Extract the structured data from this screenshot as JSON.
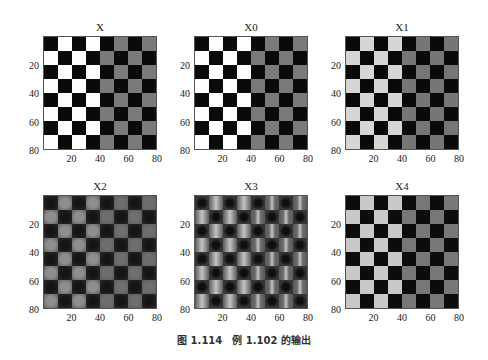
{
  "figure": {
    "caption": "图 1.114　例 1.102 的输出",
    "panels": [
      {
        "title": "X",
        "left_light": "#ffffff",
        "right_light": "#7a7a7a",
        "dark": "#0a0a0a",
        "style": "sharp"
      },
      {
        "title": "X0",
        "left_light": "#ffffff",
        "right_light": "#7a7a7a",
        "dark": "#0a0a0a",
        "style": "sharp"
      },
      {
        "title": "X1",
        "left_light": "#d6d6d6",
        "right_light": "#767676",
        "dark": "#0a0a0a",
        "style": "sharp"
      },
      {
        "title": "X2",
        "left_light": "#8e8e8e",
        "right_light": "#6e6e6e",
        "dark": "#151515",
        "style": "smooth"
      },
      {
        "title": "X3",
        "left_light": "#9a9a9a",
        "right_light": "#6a6a6a",
        "dark": "#222222",
        "style": "ringing"
      },
      {
        "title": "X4",
        "left_light": "#c8c8c8",
        "right_light": "#777777",
        "dark": "#0c0c0c",
        "style": "sharp"
      }
    ],
    "xticks": [
      "20",
      "40",
      "60",
      "80"
    ],
    "yticks": [
      "20",
      "40",
      "60",
      "80"
    ]
  },
  "chart_data": {
    "type": "heatmap",
    "layout": "2x3 grid of image plots",
    "grid_size": [
      8,
      8
    ],
    "image_extent": [
      0,
      80
    ],
    "titles": [
      "X",
      "X0",
      "X1",
      "X2",
      "X3",
      "X4"
    ],
    "xticks": [
      20,
      40,
      60,
      80
    ],
    "yticks": [
      20,
      40,
      60,
      80
    ],
    "caption": "图 1.114 例 1.102 的输出"
  }
}
